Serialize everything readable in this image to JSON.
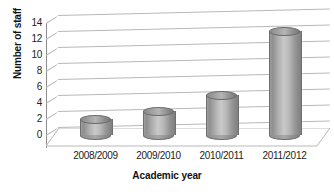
{
  "chart_data": {
    "type": "bar",
    "title": "",
    "subtitle": "",
    "xlabel": "Academic year",
    "ylabel": "Number of staff",
    "categories": [
      "2008/2009",
      "2009/2010",
      "2010/2011",
      "2011/2012"
    ],
    "values": [
      2,
      3,
      5,
      13
    ],
    "series": [
      {
        "name": "Number of staff",
        "values": [
          2,
          3,
          5,
          13
        ]
      }
    ],
    "ylim": [
      0,
      14
    ],
    "yticks": [
      0,
      2,
      4,
      6,
      8,
      10,
      12,
      14
    ],
    "ytick_labels": [
      "0",
      "2",
      "4",
      "6",
      "8",
      "10",
      "12",
      "14"
    ],
    "grid": true,
    "legend": false,
    "legend_position": "none",
    "style": "3d-cylinder",
    "bar_color": "#a9a9a9",
    "gridline_color": "#b9b9b9",
    "axis_color": "#8d8d8d",
    "text_color": "#222222",
    "background": "#ffffff"
  }
}
